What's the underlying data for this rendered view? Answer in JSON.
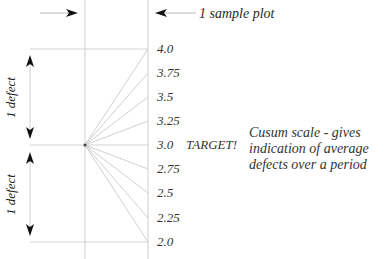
{
  "diagram": {
    "sample_plot_label": "1 sample plot",
    "scale_ticks": [
      "4.0",
      "3.75",
      "3.5",
      "3.25",
      "3.0",
      "2.75",
      "2.5",
      "2.25",
      "2.0"
    ],
    "target_label": "TARGET!",
    "note_lines": [
      "Cusum scale - gives",
      "indication of average",
      "defects over a period"
    ],
    "upper_span_label": "1 defect",
    "lower_span_label": "1 defect"
  }
}
